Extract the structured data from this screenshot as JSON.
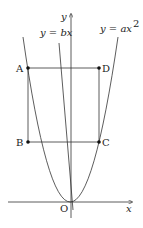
{
  "diagram": {
    "axes": {
      "x_label": "x",
      "y_label": "y",
      "origin_label": "O"
    },
    "curves": [
      {
        "name": "parabola",
        "label": "y = ax",
        "exponent": "2"
      },
      {
        "name": "line",
        "label": "y = bx"
      }
    ],
    "points": [
      {
        "name": "A"
      },
      {
        "name": "B"
      },
      {
        "name": "C"
      },
      {
        "name": "D"
      }
    ]
  }
}
